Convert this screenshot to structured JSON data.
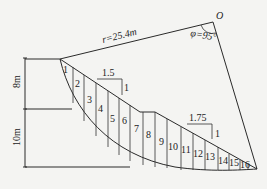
{
  "diagram": {
    "type": "slope-stability-slice-method",
    "center_label": "O",
    "radius_label": "r=25.4m",
    "angle_label": "φ=95°",
    "heights": {
      "upper": "8m",
      "lower": "10m"
    },
    "slopes": [
      {
        "horizontal": "1.5",
        "vertical": "1"
      },
      {
        "horizontal": "1.75",
        "vertical": "1"
      }
    ],
    "slices": [
      "1",
      "2",
      "3",
      "4",
      "5",
      "6",
      "7",
      "8",
      "9",
      "10",
      "11",
      "12",
      "13",
      "14",
      "15",
      "16"
    ]
  }
}
